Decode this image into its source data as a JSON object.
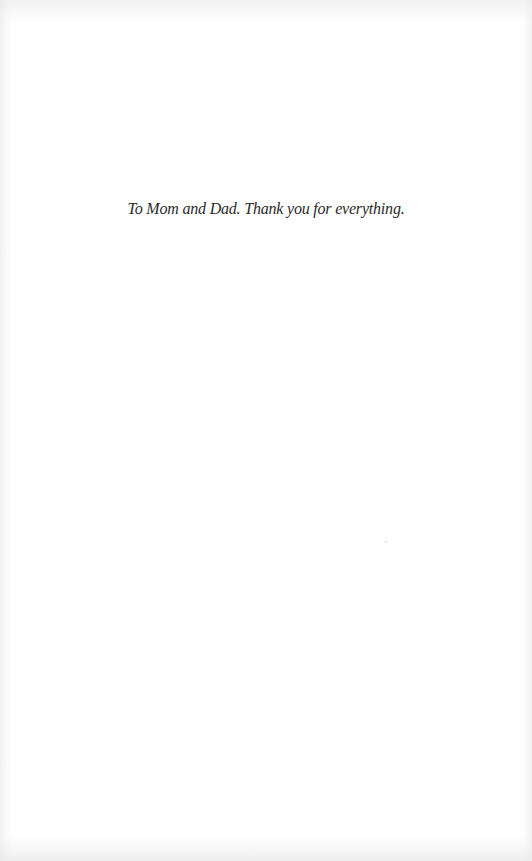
{
  "page": {
    "type": "dedication-page",
    "dedication_text": "To Mom and Dad. Thank you for everything."
  }
}
